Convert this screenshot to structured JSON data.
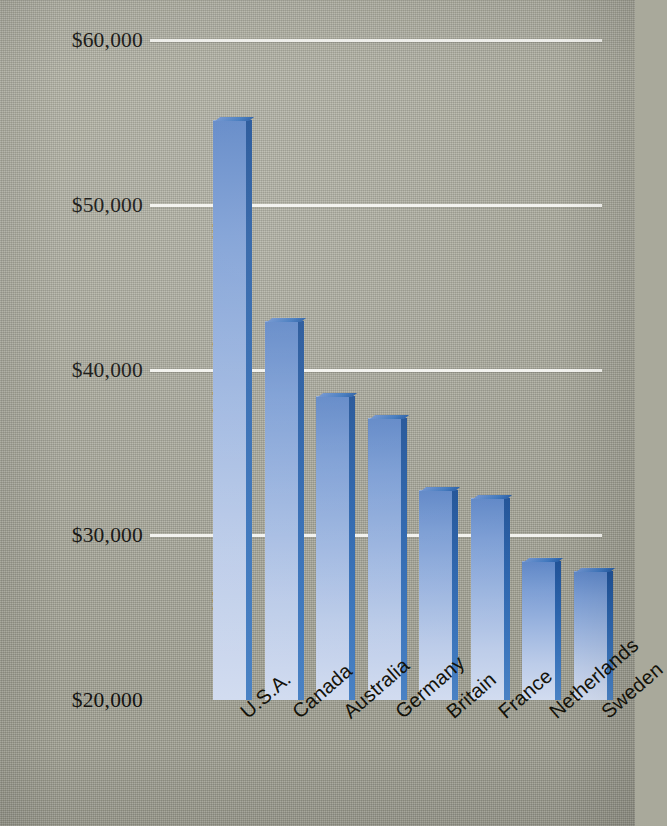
{
  "chart_data": {
    "type": "bar",
    "title": "",
    "xlabel": "",
    "ylabel": "Difference Between Rich and Poor Families",
    "categories": [
      "U.S.A.",
      "Canada",
      "Australia",
      "Germany",
      "Britain",
      "France",
      "Netherlands",
      "Sweden"
    ],
    "values": [
      55150,
      43000,
      38400,
      37100,
      32750,
      32250,
      28400,
      27800
    ],
    "ylim": [
      20000,
      60000
    ],
    "yticks": [
      20000,
      30000,
      40000,
      50000,
      60000
    ],
    "ytick_labels": [
      "$20,000",
      "$30,000",
      "$40,000",
      "$50,000",
      "$60,000"
    ],
    "grid": "horizontal",
    "legend": "none",
    "series": [
      {
        "name": "Difference Between Rich and Poor Families",
        "values": [
          55150,
          43000,
          38400,
          37100,
          32750,
          32250,
          28400,
          27800
        ]
      }
    ]
  },
  "axes": {
    "y_title": "Difference Between Rich and Poor Families",
    "y_ticks": [
      {
        "label": "$60,000",
        "value": 60000
      },
      {
        "label": "$50,000",
        "value": 50000
      },
      {
        "label": "$40,000",
        "value": 40000
      },
      {
        "label": "$30,000",
        "value": 30000
      },
      {
        "label": "$20,000",
        "value": 20000
      }
    ],
    "x_ticks": [
      {
        "label": "U.S.A."
      },
      {
        "label": "Canada"
      },
      {
        "label": "Australia"
      },
      {
        "label": "Germany"
      },
      {
        "label": "Britain"
      },
      {
        "label": "France"
      },
      {
        "label": "Netherlands"
      },
      {
        "label": "Sweden"
      }
    ]
  },
  "style": {
    "background": "#a9a99b",
    "gridline_color": "#f2f2ee",
    "bar_top_color": "#5e86c6",
    "bar_bottom_color": "#d2dcf0",
    "bar_side_color": "#2b63ab",
    "text_color": "#131209"
  }
}
